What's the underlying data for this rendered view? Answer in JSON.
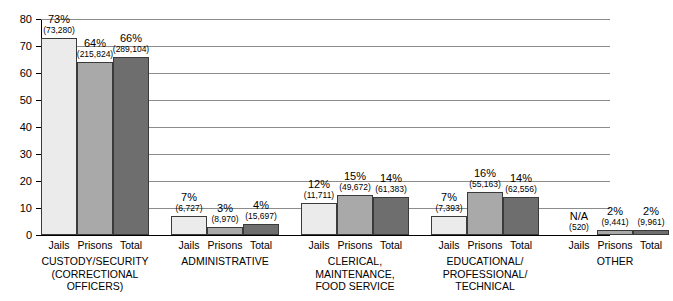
{
  "chart_data": {
    "type": "bar",
    "title": "",
    "subtitle": "",
    "xlabel": "",
    "ylabel": "",
    "ylim": [
      0,
      80
    ],
    "ytick_values": [
      0,
      10,
      20,
      30,
      40,
      50,
      60,
      70,
      80
    ],
    "ytick_labels": [
      "0",
      "10",
      "20",
      "30",
      "40",
      "50",
      "60",
      "70",
      "80"
    ],
    "grid": true,
    "legend_position": "none",
    "series_names": [
      "Jails",
      "Prisons",
      "Total"
    ],
    "series_colors": [
      "#ebebeb",
      "#a9a9a9",
      "#6e6e6e"
    ],
    "categories": [
      "CUSTODY/SECURITY (CORRECTIONAL OFFICERS)",
      "ADMINISTRATIVE",
      "CLERICAL, MAINTENANCE, FOOD SERVICE",
      "EDUCATIONAL/ PROFESSIONAL/ TECHNICAL",
      "OTHER"
    ],
    "category_label_lines": [
      [
        "CUSTODY/SECURITY",
        "(CORRECTIONAL",
        "OFFICERS)"
      ],
      [
        "ADMINISTRATIVE"
      ],
      [
        "CLERICAL,",
        "MAINTENANCE,",
        "FOOD SERVICE"
      ],
      [
        "EDUCATIONAL/",
        "PROFESSIONAL/",
        "TECHNICAL"
      ],
      [
        "OTHER"
      ]
    ],
    "series": [
      {
        "name": "Jails",
        "values": [
          73,
          7,
          12,
          7,
          null
        ],
        "percent_labels": [
          "73%",
          "7%",
          "12%",
          "7%",
          "N/A"
        ],
        "count_labels": [
          "(73,280)",
          "(6,727)",
          "(11,711)",
          "(7,393)",
          "(520)"
        ]
      },
      {
        "name": "Prisons",
        "values": [
          64,
          3,
          15,
          16,
          2
        ],
        "percent_labels": [
          "64%",
          "3%",
          "15%",
          "16%",
          "2%"
        ],
        "count_labels": [
          "(215,824)",
          "(8,970)",
          "(49,672)",
          "(55,163)",
          "(9,441)"
        ]
      },
      {
        "name": "Total",
        "values": [
          66,
          4,
          14,
          14,
          2
        ],
        "percent_labels": [
          "66%",
          "4%",
          "14%",
          "14%",
          "2%"
        ],
        "count_labels": [
          "(289,104)",
          "(15,697)",
          "(61,383)",
          "(62,556)",
          "(9,961)"
        ]
      }
    ]
  },
  "ticks": {
    "t0": "0",
    "t1": "10",
    "t2": "20",
    "t3": "30",
    "t4": "40",
    "t5": "50",
    "t6": "60",
    "t7": "70",
    "t8": "80"
  }
}
